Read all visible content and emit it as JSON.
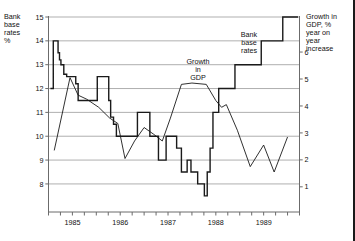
{
  "chart_data": {
    "type": "line",
    "title": "",
    "subtitle": "",
    "grid": true,
    "legend_position": "inline-annotations",
    "xlabel": "",
    "x_tick_labels": [
      "1985",
      "1986",
      "1987",
      "1988",
      "1989"
    ],
    "x_tick_label_values": [
      1985.0,
      1986.0,
      1987.0,
      1988.0,
      1989.0
    ],
    "x_minor_tick_interval": 0.25,
    "xlim": [
      1984.5,
      1989.75
    ],
    "left_axis": {
      "label": "Bank\nbase\nrates\n%",
      "ylim": [
        7.2,
        15.0
      ],
      "ticks": [
        8,
        9,
        10,
        11,
        12,
        13,
        14,
        15
      ],
      "tick_labels": [
        "8",
        "9",
        "10",
        "11",
        "12",
        "13",
        "14",
        "15"
      ]
    },
    "right_axis": {
      "label": "Growth in\nGDP, %\nyear on\nyear\nincrease",
      "ylim": [
        0.4,
        7.3
      ],
      "ticks": [
        1,
        2,
        3,
        4,
        5,
        6
      ],
      "tick_labels": [
        "1",
        "2",
        "3",
        "4",
        "5",
        "6"
      ]
    },
    "annotations": [
      {
        "id": "gdp",
        "text": "Growth\nin\nGDP"
      },
      {
        "id": "base-rates",
        "text": "Bank\nbase\nrates"
      }
    ],
    "series": [
      {
        "name": "Bank base rates",
        "axis": "left",
        "style": "step",
        "color": "#1a1a1a",
        "width": 1.4,
        "points": [
          [
            1984.54,
            12.0
          ],
          [
            1984.6,
            12.0
          ],
          [
            1984.6,
            14.0
          ],
          [
            1984.7,
            14.0
          ],
          [
            1984.7,
            13.5
          ],
          [
            1984.73,
            13.5
          ],
          [
            1984.73,
            13.2
          ],
          [
            1984.76,
            13.2
          ],
          [
            1984.76,
            13.0
          ],
          [
            1984.82,
            13.0
          ],
          [
            1984.82,
            12.6
          ],
          [
            1984.88,
            12.6
          ],
          [
            1984.88,
            12.5
          ],
          [
            1985.07,
            12.5
          ],
          [
            1985.07,
            12.2
          ],
          [
            1985.12,
            12.2
          ],
          [
            1985.12,
            11.5
          ],
          [
            1985.52,
            11.5
          ],
          [
            1985.52,
            12.5
          ],
          [
            1985.76,
            12.5
          ],
          [
            1985.76,
            11.5
          ],
          [
            1985.8,
            11.5
          ],
          [
            1985.8,
            10.8
          ],
          [
            1985.86,
            10.8
          ],
          [
            1985.86,
            10.5
          ],
          [
            1985.92,
            10.5
          ],
          [
            1985.92,
            10.0
          ],
          [
            1986.36,
            10.0
          ],
          [
            1986.36,
            11.0
          ],
          [
            1986.62,
            11.0
          ],
          [
            1986.62,
            10.0
          ],
          [
            1986.8,
            10.0
          ],
          [
            1986.8,
            9.0
          ],
          [
            1986.96,
            9.0
          ],
          [
            1986.96,
            10.0
          ],
          [
            1987.18,
            10.0
          ],
          [
            1987.18,
            9.5
          ],
          [
            1987.28,
            9.5
          ],
          [
            1987.28,
            8.5
          ],
          [
            1987.4,
            8.5
          ],
          [
            1987.4,
            9.0
          ],
          [
            1987.48,
            9.0
          ],
          [
            1987.48,
            8.5
          ],
          [
            1987.62,
            8.5
          ],
          [
            1987.62,
            8.0
          ],
          [
            1987.76,
            8.0
          ],
          [
            1987.76,
            7.5
          ],
          [
            1987.82,
            7.5
          ],
          [
            1987.82,
            8.5
          ],
          [
            1987.88,
            8.5
          ],
          [
            1987.88,
            9.5
          ],
          [
            1987.94,
            9.5
          ],
          [
            1987.94,
            11.0
          ],
          [
            1988.06,
            11.0
          ],
          [
            1988.06,
            12.0
          ],
          [
            1988.4,
            12.0
          ],
          [
            1988.4,
            13.0
          ],
          [
            1988.95,
            13.0
          ],
          [
            1988.95,
            14.0
          ],
          [
            1989.4,
            14.0
          ],
          [
            1989.4,
            15.0
          ],
          [
            1989.72,
            15.0
          ]
        ]
      },
      {
        "name": "Growth in GDP",
        "axis": "right",
        "style": "line",
        "color": "#1a1a1a",
        "width": 0.9,
        "points": [
          [
            1984.62,
            2.35
          ],
          [
            1984.95,
            5.05
          ],
          [
            1985.12,
            4.4
          ],
          [
            1985.3,
            4.25
          ],
          [
            1985.55,
            3.95
          ],
          [
            1985.78,
            3.55
          ],
          [
            1985.95,
            3.35
          ],
          [
            1986.1,
            2.05
          ],
          [
            1986.3,
            2.7
          ],
          [
            1986.5,
            3.2
          ],
          [
            1986.7,
            2.95
          ],
          [
            1986.88,
            2.7
          ],
          [
            1987.05,
            3.55
          ],
          [
            1987.28,
            4.8
          ],
          [
            1987.5,
            4.85
          ],
          [
            1987.8,
            4.8
          ],
          [
            1988.0,
            4.2
          ],
          [
            1988.12,
            3.95
          ],
          [
            1988.22,
            4.05
          ],
          [
            1988.45,
            3.1
          ],
          [
            1988.72,
            1.75
          ],
          [
            1989.0,
            2.55
          ],
          [
            1989.22,
            1.55
          ],
          [
            1989.5,
            2.85
          ]
        ]
      }
    ]
  },
  "figure": {
    "left_caption": "Bank\nbase\nrates\n%",
    "right_caption": "Growth in\nGDP, %\nyear on\nyear\nincrease"
  }
}
